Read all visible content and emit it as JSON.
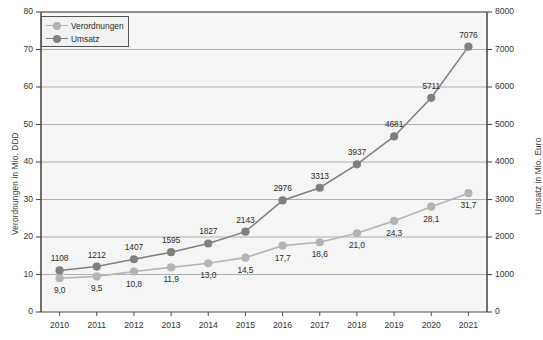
{
  "chart_data": {
    "type": "line",
    "title": "",
    "xlabel": "",
    "categories": [
      "2010",
      "2011",
      "2012",
      "2013",
      "2014",
      "2015",
      "2016",
      "2017",
      "2018",
      "2019",
      "2020",
      "2021"
    ],
    "grid": true,
    "legend_position": "top-left",
    "axes": {
      "left": {
        "label": "Verordnungen in Mio. DDD",
        "ticks": [
          "0",
          "10",
          "20",
          "30",
          "40",
          "50",
          "60",
          "70",
          "80"
        ],
        "min": 0,
        "max": 80
      },
      "right": {
        "label": "Umsatz in Mio. Euro",
        "ticks": [
          "0",
          "1000",
          "2000",
          "3000",
          "4000",
          "5000",
          "6000",
          "7000",
          "8000"
        ],
        "min": 0,
        "max": 8000
      }
    },
    "series": [
      {
        "name": "Verordnungen",
        "axis": "left",
        "color": "#b4b4b4",
        "values": [
          9.0,
          9.5,
          10.8,
          11.9,
          13.0,
          14.5,
          17.7,
          18.6,
          21.0,
          24.3,
          28.1,
          31.7
        ],
        "labels": [
          "9,0",
          "9,5",
          "10,8",
          "11,9",
          "13,0",
          "14,5",
          "17,7",
          "18,6",
          "21,0",
          "24,3",
          "28,1",
          "31,7"
        ]
      },
      {
        "name": "Umsatz",
        "axis": "right",
        "color": "#808080",
        "values": [
          1108,
          1212,
          1407,
          1595,
          1827,
          2143,
          2976,
          3313,
          3937,
          4681,
          5711,
          7076
        ],
        "labels": [
          "1108",
          "1212",
          "1407",
          "1595",
          "1827",
          "2143",
          "2976",
          "3313",
          "3937",
          "4681",
          "5711",
          "7076"
        ]
      }
    ]
  },
  "legend": {
    "items": [
      {
        "label": "Verordnungen"
      },
      {
        "label": "Umsatz"
      }
    ]
  },
  "colors": {
    "plot_background": "#f5f5f5",
    "gridline": "#a8a8a8",
    "axis": "#4d4d4d",
    "series_verordnungen": "#b4b4b4",
    "series_umsatz": "#808080"
  }
}
